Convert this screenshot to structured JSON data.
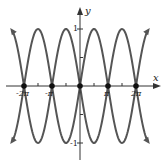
{
  "chart_data": {
    "type": "line",
    "title": "",
    "xlabel": "x",
    "ylabel": "y",
    "x_ticks": [
      {
        "value": -6.2832,
        "label": "-2π"
      },
      {
        "value": -3.1416,
        "label": "-π"
      },
      {
        "value": 3.1416,
        "label": "π"
      },
      {
        "value": 6.2832,
        "label": "2π"
      }
    ],
    "y_ticks": [
      {
        "value": 1,
        "label": "1"
      },
      {
        "value": -1,
        "label": "-1"
      }
    ],
    "xlim": [
      -7.6,
      7.6
    ],
    "ylim": [
      -1.25,
      1.25
    ],
    "grid": false,
    "legend": null,
    "series": [
      {
        "name": "y = sin x",
        "function": "sin(x)",
        "x_range": [
          -7.6,
          7.6
        ],
        "color": "#555555"
      },
      {
        "name": "y = -sin x",
        "function": "-sin(x)",
        "x_range": [
          -7.6,
          7.6
        ],
        "color": "#555555"
      }
    ],
    "marked_points": [
      {
        "x": -6.2832,
        "y": 0
      },
      {
        "x": -3.1416,
        "y": 0
      },
      {
        "x": 0,
        "y": 0
      },
      {
        "x": 3.1416,
        "y": 0
      },
      {
        "x": 6.2832,
        "y": 0
      }
    ],
    "minor_ticks_x": [
      -4.7124,
      -1.5708,
      1.5708,
      4.7124
    ],
    "minor_ticks_y": [
      0.5,
      -0.5
    ]
  },
  "labels": {
    "x_axis": "x",
    "y_axis": "y",
    "x_neg2pi": "-2π",
    "x_negpi": "-π",
    "x_pi": "π",
    "x_2pi": "2π",
    "y_1": "1",
    "y_neg1": "-1"
  },
  "colors": {
    "curve": "#555555",
    "axis": "#333333",
    "point": "#111111"
  }
}
